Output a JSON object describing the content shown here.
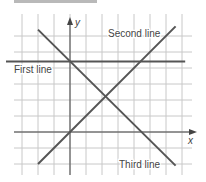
{
  "chart_data": {
    "type": "line",
    "title": "",
    "xlabel": "x",
    "ylabel": "y",
    "grid": true,
    "xlim": [
      -3,
      7
    ],
    "ylim": [
      -2,
      6
    ],
    "series": [
      {
        "name": "First line",
        "equation": "y = 4.4",
        "points": [
          [
            -4,
            4.4
          ],
          [
            7.2,
            4.4
          ]
        ]
      },
      {
        "name": "Second line",
        "equation": "y = x",
        "points": [
          [
            -2,
            -2
          ],
          [
            6.6,
            6.6
          ]
        ]
      },
      {
        "name": "Third line",
        "equation": "y = 4.4 - x",
        "points": [
          [
            -2,
            6.4
          ],
          [
            6.6,
            -2.1
          ]
        ]
      }
    ],
    "annotations": [
      {
        "text": "First line",
        "position": "left, below first line"
      },
      {
        "text": "Second line",
        "position": "top-right, near second line end"
      },
      {
        "text": "Third line",
        "position": "bottom-right, near third line end"
      }
    ]
  },
  "colors": {
    "grid": "#c8c8c8",
    "axis": "#444444",
    "line": "#555555",
    "topbar": "#b9b9b9"
  }
}
